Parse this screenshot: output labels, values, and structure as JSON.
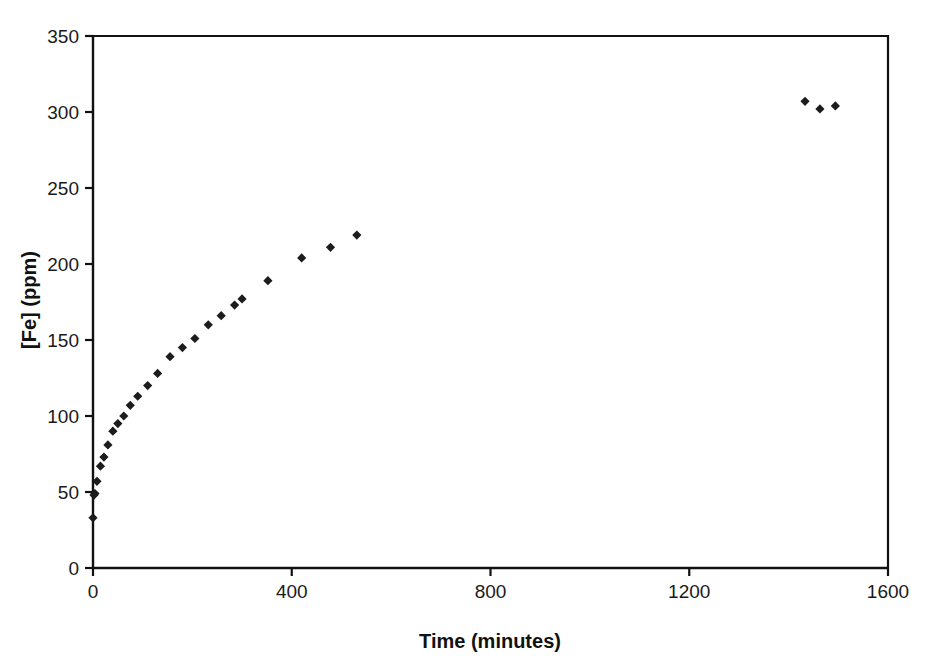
{
  "chart_data": {
    "type": "scatter",
    "title": "",
    "xlabel": "Time (minutes)",
    "ylabel": "[Fe] (ppm)",
    "xlim": [
      0,
      1600
    ],
    "ylim": [
      0,
      350
    ],
    "xticks": [
      0,
      400,
      800,
      1200,
      1600
    ],
    "yticks": [
      0,
      50,
      100,
      150,
      200,
      250,
      300,
      350
    ],
    "xtick_labels": [
      "0",
      "400",
      "800",
      "1200",
      "1600"
    ],
    "ytick_labels": [
      "0",
      "50",
      "100",
      "150",
      "200",
      "250",
      "300",
      "350"
    ],
    "grid": false,
    "legend": null,
    "marker": "diamond",
    "marker_color": "#1c1c1c",
    "marker_size": 8,
    "series": [
      {
        "name": "[Fe] dissolution",
        "x": [
          0,
          2,
          4,
          8,
          15,
          22,
          30,
          40,
          50,
          62,
          75,
          90,
          110,
          130,
          155,
          180,
          205,
          232,
          258,
          285,
          300,
          352,
          420,
          478,
          531,
          1433,
          1463,
          1494
        ],
        "y": [
          33,
          48,
          49,
          57,
          67,
          73,
          81,
          90,
          95,
          100,
          107,
          113,
          120,
          128,
          139,
          145,
          151,
          160,
          166,
          173,
          177,
          189,
          204,
          211,
          219,
          307,
          302,
          304
        ]
      }
    ]
  },
  "axes": {
    "x_axis_name": "time-axis",
    "y_axis_name": "concentration-axis"
  }
}
